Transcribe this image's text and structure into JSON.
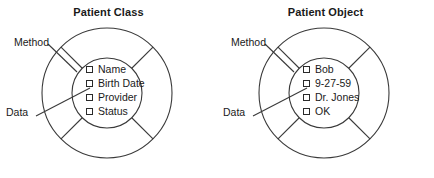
{
  "figure": {
    "type": "diagram",
    "stroke_color": "#3a3a3a",
    "text_color": "#1a1a1a",
    "background_color": "#ffffff"
  },
  "diagrams": [
    {
      "id": "patient-class",
      "title": "Patient Class",
      "labels": {
        "method": "Method",
        "data": "Data"
      },
      "attributes": [
        {
          "label": "Name",
          "checked": false
        },
        {
          "label": "Birth Date",
          "checked": false
        },
        {
          "label": "Provider",
          "checked": false
        },
        {
          "label": "Status",
          "checked": false
        }
      ]
    },
    {
      "id": "patient-object",
      "title": "Patient Object",
      "labels": {
        "method": "Method",
        "data": "Data"
      },
      "attributes": [
        {
          "label": "Bob",
          "checked": false
        },
        {
          "label": "9-27-59",
          "checked": false
        },
        {
          "label": "Dr. Jones",
          "checked": false
        },
        {
          "label": "OK",
          "checked": false
        }
      ]
    }
  ]
}
